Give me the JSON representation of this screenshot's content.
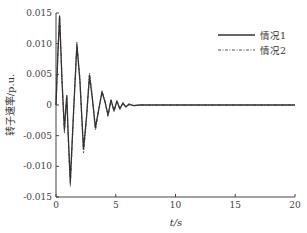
{
  "chart_data": {
    "type": "line",
    "title": "",
    "xlabel": "t/s",
    "ylabel": "转子速率/p.u.",
    "xlim": [
      0,
      20
    ],
    "ylim": [
      -0.015,
      0.015
    ],
    "xticks": [
      0,
      5,
      10,
      15,
      20
    ],
    "xtick_labels": [
      "0",
      "5",
      "10",
      "15",
      "20"
    ],
    "yticks": [
      0.015,
      0.01,
      0.005,
      0,
      -0.005,
      -0.01,
      -0.015
    ],
    "ytick_labels": [
      "0.015",
      "0.010",
      "0.005",
      "0",
      "-0.005",
      "-0.010",
      "-0.015"
    ],
    "grid": false,
    "legend_position": "upper right",
    "series": [
      {
        "name": "情况1",
        "style": "solid",
        "color": "#333333",
        "x": [
          0,
          0.15,
          0.3,
          0.5,
          0.7,
          0.8,
          0.9,
          1.0,
          1.2,
          1.45,
          1.75,
          2.0,
          2.3,
          2.55,
          2.8,
          3.05,
          3.3,
          3.55,
          3.85,
          4.1,
          4.35,
          4.6,
          4.85,
          5.1,
          5.35,
          5.6,
          5.85,
          6.1,
          6.5,
          7,
          8,
          10,
          15,
          20
        ],
        "y": [
          0,
          0.008,
          0.0145,
          0.004,
          -0.004,
          -0.001,
          0.0015,
          -0.004,
          -0.0125,
          -0.002,
          0.0098,
          0.004,
          -0.0072,
          -0.002,
          0.0048,
          0.001,
          -0.0037,
          -0.001,
          0.0021,
          0.0005,
          -0.0016,
          0.0008,
          -0.0009,
          0.0006,
          -0.0006,
          0.0003,
          -0.0003,
          0.0001,
          -0.0001,
          0,
          0,
          0,
          0,
          0
        ]
      },
      {
        "name": "情况2",
        "style": "dashdot",
        "color": "#555555",
        "x": [
          0,
          0.15,
          0.3,
          0.5,
          0.7,
          0.8,
          0.9,
          1.0,
          1.2,
          1.45,
          1.75,
          2.0,
          2.3,
          2.55,
          2.8,
          3.05,
          3.3,
          3.55,
          3.85,
          4.1,
          4.35,
          4.6,
          4.85,
          5.1,
          5.35,
          5.6,
          5.85,
          6.1,
          6.5,
          7,
          8,
          10,
          15,
          20
        ],
        "y": [
          0,
          0.0082,
          0.0145,
          0.0042,
          -0.0045,
          -0.0012,
          0.0016,
          -0.0045,
          -0.0133,
          -0.0022,
          0.0102,
          0.0042,
          -0.0078,
          -0.0022,
          0.0052,
          0.0012,
          -0.0041,
          -0.0012,
          0.0024,
          0.0006,
          -0.0019,
          0.0009,
          -0.0011,
          0.0007,
          -0.0007,
          0.0004,
          -0.0004,
          0.0002,
          -0.0001,
          0,
          0,
          0,
          0,
          0
        ]
      }
    ]
  }
}
